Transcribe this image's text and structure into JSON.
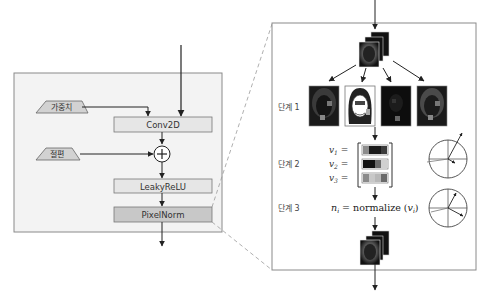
{
  "left_panel": {
    "inputs": {
      "weights_label": "가중치",
      "bias_label": "절편"
    },
    "layers": [
      {
        "label": "Conv2D",
        "fill": "#e6e6e6"
      },
      {
        "label": "LeakyReLU",
        "fill": "#e6e6e6"
      },
      {
        "label": "PixelNorm",
        "fill": "#c8c8c8"
      }
    ],
    "add_symbol": "+"
  },
  "right_panel": {
    "steps": [
      {
        "label": "단계 1"
      },
      {
        "label": "단계 2"
      },
      {
        "label": "단계 3"
      }
    ],
    "vectors": [
      {
        "name": "v1",
        "label": "v",
        "sub": "1",
        "eq": "=",
        "cells": [
          "#8c8c8c",
          "#1a1a1a",
          "#1a1a1a",
          "#3c3c3c"
        ]
      },
      {
        "name": "v2",
        "label": "v",
        "sub": "2",
        "eq": "=",
        "cells": [
          "#111111",
          "#111111",
          "#6a6a6a",
          "#d0d0d0"
        ]
      },
      {
        "name": "v3",
        "label": "v",
        "sub": "3",
        "eq": "=",
        "cells": [
          "#8a8a8a",
          "#c8c8c8",
          "#b8b8b8",
          "#6a6a6a"
        ]
      }
    ],
    "formula": {
      "lhs": "n",
      "lhs_sub": "i",
      "eq": " = normalize (",
      "arg": "v",
      "arg_sub": "i",
      "close": ")"
    }
  },
  "colors": {
    "panel_bg": "#f3f3f3",
    "border": "#8a8a8a",
    "arrow": "#222222",
    "dashed": "#9a9a9a"
  }
}
